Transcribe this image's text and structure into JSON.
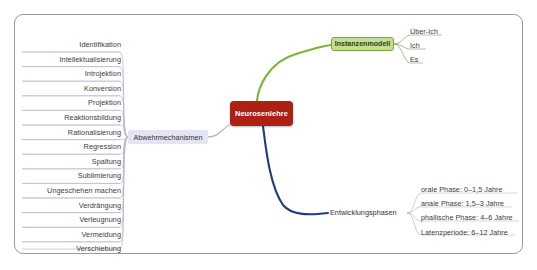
{
  "diagram": {
    "center": {
      "label": "Neurosenlehre",
      "color": "#ab2114",
      "text_color": "#ffffff"
    },
    "branches": {
      "abwehrmechanismen": {
        "label": "Abwehrmechanismen",
        "color": "#b9b9cd",
        "node_fill": "#e4e4f2",
        "children": [
          {
            "label": "Identifikation"
          },
          {
            "label": "Intellektualisierung"
          },
          {
            "label": "Introjektion"
          },
          {
            "label": "Konversion"
          },
          {
            "label": "Projektion"
          },
          {
            "label": "Reaktionsbildung"
          },
          {
            "label": "Rationalisierung"
          },
          {
            "label": "Regression"
          },
          {
            "label": "Spaltung"
          },
          {
            "label": "Sublimierung"
          },
          {
            "label": "Ungeschehen machen"
          },
          {
            "label": "Verdrängung"
          },
          {
            "label": "Verleugnung"
          },
          {
            "label": "Vermeidung"
          },
          {
            "label": "Verschiebung"
          }
        ]
      },
      "instanzenmodell": {
        "label": "Instanzenmodell",
        "color": "#79b42e",
        "node_fill": "#c3e090",
        "node_border": "#7aa63e",
        "children": [
          {
            "label": "Über-Ich"
          },
          {
            "label": "Ich"
          },
          {
            "label": "Es"
          }
        ]
      },
      "entwicklungsphasen": {
        "label": "Entwicklungsphasen",
        "color": "#1f3d7a",
        "children": [
          {
            "label": "orale Phase: 0–1,5 Jahre"
          },
          {
            "label": "anale Phase: 1,5–3 Jahre"
          },
          {
            "label": "phallische Phase: 4–6 Jahre"
          },
          {
            "label": "Latenzperiode: 6–12 Jahre"
          }
        ]
      }
    },
    "frame": {
      "border_color": "#9a9a9a"
    }
  }
}
